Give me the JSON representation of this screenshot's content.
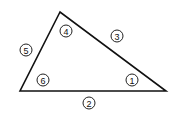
{
  "diagram": {
    "type": "triangle",
    "stroke_color": "#111111",
    "vertices": {
      "top": [
        60,
        12
      ],
      "bottom_left": [
        20,
        91
      ],
      "bottom_right": [
        166,
        91
      ]
    },
    "labels": [
      {
        "id": "1",
        "text": "1",
        "role": "angle",
        "position": [
          132,
          80
        ]
      },
      {
        "id": "2",
        "text": "2",
        "role": "side",
        "position": [
          89,
          103
        ]
      },
      {
        "id": "3",
        "text": "3",
        "role": "side",
        "position": [
          117,
          36
        ]
      },
      {
        "id": "4",
        "text": "4",
        "role": "angle",
        "position": [
          66,
          31
        ]
      },
      {
        "id": "5",
        "text": "5",
        "role": "side",
        "position": [
          26,
          50
        ]
      },
      {
        "id": "6",
        "text": "6",
        "role": "angle",
        "position": [
          43,
          80
        ]
      }
    ]
  }
}
